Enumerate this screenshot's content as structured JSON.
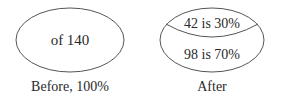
{
  "before": {
    "inner_text": "of 140",
    "caption": "Before, 100%"
  },
  "after": {
    "top_text": "42 is 30%",
    "bottom_text": "98 is 70%",
    "caption": "After"
  },
  "colors": {
    "stroke": "#555555",
    "text": "#2a2a2a",
    "background": "#ffffff"
  }
}
